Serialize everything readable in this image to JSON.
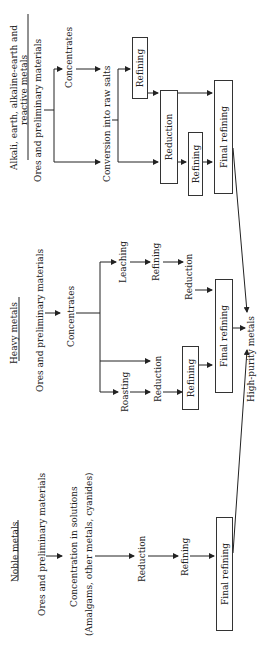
{
  "diagram": {
    "alkali": {
      "title_line1": "Alkali, earth, alkaline-earth and",
      "title_line2": "reactive metals",
      "ores": "Ores and preliminary materials",
      "concentrates": "Concentrates",
      "conversion": "Conversion into raw salts",
      "refining1": "Refining",
      "reduction": "Reduction",
      "refining2": "Refining",
      "final_refining": "Final refining"
    },
    "heavy": {
      "title": "Heavy metals",
      "ores": "Ores and preliminary materials",
      "concentrates": "Concentrates",
      "leaching": "Leaching",
      "leach_refining": "Refining",
      "leach_reduction": "Reduction",
      "roasting": "Roasting",
      "roast_reduction": "Reduction",
      "direct_reduction": "Reduction",
      "refining": "Refining",
      "final_refining": "Final refining"
    },
    "noble": {
      "title": "Noble metals",
      "ores": "Ores and preliminary materials",
      "concentration": "Concentration in solutions",
      "concentration_note": "(Amalgams, other metals, cyanides)",
      "reduction": "Reduction",
      "refining": "Refining",
      "final_refining": "Final refining"
    },
    "output": "High-purity metals"
  }
}
